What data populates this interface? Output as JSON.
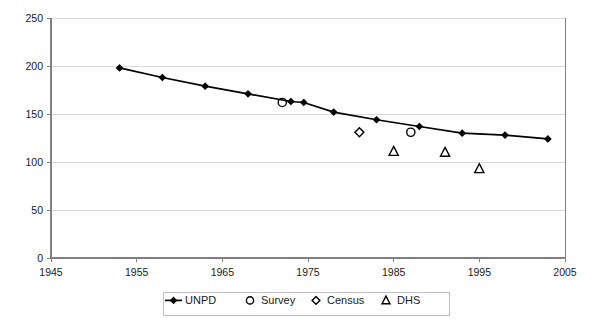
{
  "chart_data": {
    "type": "line",
    "title": "",
    "subtitle": "",
    "xlabel": "",
    "ylabel": "",
    "xlim": [
      1945,
      2005
    ],
    "ylim": [
      0,
      250
    ],
    "xticks": [
      1945,
      1955,
      1965,
      1975,
      1985,
      1995,
      2005
    ],
    "yticks": [
      0,
      50,
      100,
      150,
      200,
      250
    ],
    "grid": "horizontal",
    "legend_position": "bottom",
    "series": [
      {
        "name": "UNPD",
        "marker": "line-with-markers",
        "points": [
          {
            "x": 1953,
            "y": 198
          },
          {
            "x": 1958,
            "y": 188
          },
          {
            "x": 1963,
            "y": 179
          },
          {
            "x": 1968,
            "y": 171
          },
          {
            "x": 1973,
            "y": 163
          },
          {
            "x": 1974.5,
            "y": 162
          },
          {
            "x": 1978,
            "y": 152
          },
          {
            "x": 1983,
            "y": 144
          },
          {
            "x": 1988,
            "y": 137
          },
          {
            "x": 1993,
            "y": 130
          },
          {
            "x": 1998,
            "y": 128
          },
          {
            "x": 2003,
            "y": 124
          }
        ]
      },
      {
        "name": "Survey",
        "marker": "circle",
        "points": [
          {
            "x": 1972,
            "y": 162
          },
          {
            "x": 1987,
            "y": 131
          }
        ]
      },
      {
        "name": "Census",
        "marker": "diamond",
        "points": [
          {
            "x": 1981,
            "y": 131
          }
        ]
      },
      {
        "name": "DHS",
        "marker": "triangle",
        "points": [
          {
            "x": 1985,
            "y": 111
          },
          {
            "x": 1991,
            "y": 110
          },
          {
            "x": 1995,
            "y": 93
          }
        ]
      }
    ]
  },
  "legend": {
    "items": [
      {
        "label": "UNPD",
        "marker": "line-with-marker-icon"
      },
      {
        "label": "Survey",
        "marker": "circle-icon"
      },
      {
        "label": "Census",
        "marker": "diamond-icon"
      },
      {
        "label": "DHS",
        "marker": "triangle-icon"
      }
    ]
  },
  "colors": {
    "series": "#000000",
    "axis": "#808080",
    "grid": "#d9d9d9",
    "text": "#1a1a1a",
    "background": "#ffffff"
  }
}
